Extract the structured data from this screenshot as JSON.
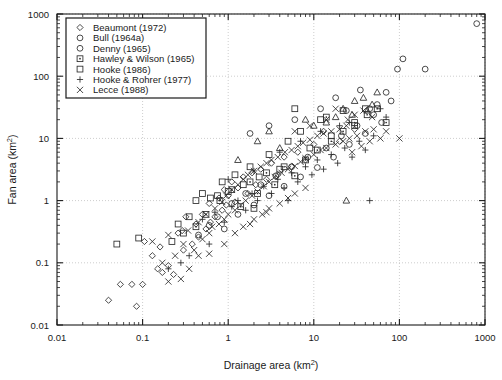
{
  "chart_data": {
    "type": "scatter",
    "title": "",
    "xlabel": "Drainage area (km2)",
    "ylabel": "Fan area (km2)",
    "xlabel_base": "Drainage area (km",
    "xlabel_sup": "2",
    "xlabel_tail": ")",
    "ylabel_base": "Fan area (km",
    "ylabel_sup": "2",
    "ylabel_tail": ")",
    "xscale": "log",
    "yscale": "log",
    "xlim": [
      0.01,
      1000
    ],
    "ylim": [
      0.01,
      1000
    ],
    "grid": true,
    "grid_style": "dotted",
    "legend_position": "top-left-inside",
    "xticks": [
      "0.01",
      "0.1",
      "1",
      "10",
      "100",
      "1000"
    ],
    "xtick_values": [
      0.01,
      0.1,
      1,
      10,
      100,
      1000
    ],
    "yticks": [
      "0.01",
      "0.1",
      "1",
      "10",
      "100",
      "1000"
    ],
    "ytick_values": [
      0.01,
      0.1,
      1,
      10,
      100,
      1000
    ],
    "series": [
      {
        "name": "Beaumont (1972)",
        "marker": "diamond",
        "points": [
          [
            0.04,
            0.025
          ],
          [
            0.055,
            0.045
          ],
          [
            0.075,
            0.045
          ],
          [
            0.085,
            0.02
          ],
          [
            0.1,
            0.045
          ],
          [
            0.105,
            0.22
          ],
          [
            0.13,
            0.13
          ],
          [
            0.15,
            0.08
          ],
          [
            0.16,
            0.18
          ],
          [
            0.17,
            0.07
          ],
          [
            0.2,
            0.09
          ],
          [
            0.23,
            0.065
          ],
          [
            0.26,
            0.3
          ],
          [
            0.29,
            0.33
          ],
          [
            0.3,
            0.16
          ],
          [
            0.32,
            0.55
          ],
          [
            0.38,
            0.2
          ],
          [
            0.42,
            0.42
          ],
          [
            0.45,
            0.26
          ],
          [
            0.5,
            0.6
          ],
          [
            0.55,
            0.35
          ],
          [
            0.6,
            0.9
          ],
          [
            0.62,
            0.45
          ],
          [
            0.7,
            0.55
          ],
          [
            0.78,
            1.1
          ],
          [
            0.85,
            0.7
          ],
          [
            0.9,
            1.5
          ],
          [
            0.95,
            0.85
          ],
          [
            1.0,
            1.2
          ],
          [
            1.1,
            2.0
          ],
          [
            1.2,
            0.95
          ],
          [
            1.3,
            1.6
          ],
          [
            1.5,
            2.4
          ],
          [
            1.7,
            1.3
          ],
          [
            1.9,
            2.8
          ],
          [
            2.1,
            1.8
          ],
          [
            2.4,
            3.2
          ],
          [
            2.8,
            2.2
          ],
          [
            3.2,
            4.0
          ],
          [
            3.8,
            2.6
          ],
          [
            4.5,
            5.0
          ],
          [
            5.5,
            3.5
          ],
          [
            6.5,
            6.0
          ],
          [
            8.0,
            4.5
          ],
          [
            10.0,
            8.0
          ],
          [
            13.0,
            13.0
          ],
          [
            20.0,
            9.0
          ],
          [
            30.0,
            14.0
          ]
        ]
      },
      {
        "name": "Bull (1964a)",
        "marker": "circle",
        "points": [
          [
            0.45,
            0.28
          ],
          [
            0.6,
            0.4
          ],
          [
            0.75,
            0.55
          ],
          [
            0.9,
            0.35
          ],
          [
            1.1,
            0.9
          ],
          [
            1.3,
            0.6
          ],
          [
            1.6,
            1.3
          ],
          [
            2.0,
            0.85
          ],
          [
            2.4,
            1.8
          ],
          [
            3.0,
            1.2
          ],
          [
            3.6,
            2.5
          ],
          [
            4.5,
            1.7
          ],
          [
            5.5,
            3.5
          ],
          [
            7.0,
            2.4
          ],
          [
            8.5,
            5.0
          ],
          [
            11.0,
            3.4
          ],
          [
            14.0,
            7.0
          ],
          [
            17.0,
            5.0
          ],
          [
            21.0,
            11.0
          ],
          [
            26.0,
            8.0
          ],
          [
            32.0,
            16.0
          ],
          [
            40.0,
            12.0
          ],
          [
            50.0,
            24.0
          ],
          [
            55.0,
            35.0
          ],
          [
            62.0,
            18.0
          ],
          [
            70.0,
            55.0
          ],
          [
            80.0,
            40.0
          ],
          [
            95.0,
            130.0
          ],
          [
            110.0,
            190.0
          ],
          [
            200.0,
            130.0
          ],
          [
            800.0,
            700.0
          ],
          [
            1.8,
            12.0
          ],
          [
            3.0,
            16.0
          ],
          [
            6.0,
            20.0
          ],
          [
            12.0,
            30.0
          ],
          [
            18.0,
            45.0
          ],
          [
            24.0,
            28.0
          ],
          [
            35.0,
            60.0
          ],
          [
            45.0,
            30.0
          ]
        ]
      },
      {
        "name": "Denny (1965)",
        "marker": "triangle",
        "points": [
          [
            1.3,
            4.5
          ],
          [
            2.2,
            9.0
          ],
          [
            3.0,
            13.0
          ],
          [
            4.0,
            7.0
          ],
          [
            8.0,
            20.0
          ],
          [
            14.0,
            18.0
          ],
          [
            22.0,
            30.0
          ],
          [
            28.0,
            24.0
          ],
          [
            38.0,
            45.0
          ],
          [
            48.0,
            35.0
          ],
          [
            55.0,
            55.0
          ],
          [
            24.0,
            1.0
          ],
          [
            30.0,
            40.0
          ],
          [
            42.0,
            28.0
          ],
          [
            18.0,
            22.0
          ],
          [
            10.0,
            16.0
          ]
        ]
      },
      {
        "name": "Hawley & Wilson (1965)",
        "marker": "square-dot",
        "points": [
          [
            0.8,
            1.0
          ],
          [
            1.1,
            1.5
          ],
          [
            1.4,
            0.8
          ],
          [
            1.8,
            2.0
          ],
          [
            2.2,
            1.3
          ],
          [
            2.8,
            2.8
          ],
          [
            3.5,
            1.8
          ],
          [
            4.5,
            3.5
          ],
          [
            6.0,
            2.5
          ],
          [
            8.0,
            4.5
          ],
          [
            11.0,
            6.5
          ],
          [
            16.0,
            9.0
          ],
          [
            22.0,
            13.0
          ],
          [
            30.0,
            18.0
          ],
          [
            42.0,
            24.0
          ],
          [
            55.0,
            30.0
          ],
          [
            70.0,
            18.0
          ],
          [
            0.55,
            0.6
          ],
          [
            0.42,
            0.38
          ],
          [
            14.0,
            22.0
          ]
        ]
      },
      {
        "name": "Hooke (1986)",
        "marker": "square",
        "points": [
          [
            0.05,
            0.2
          ],
          [
            0.09,
            0.25
          ],
          [
            0.22,
            0.22
          ],
          [
            0.3,
            0.3
          ],
          [
            0.42,
            1.0
          ],
          [
            0.5,
            1.3
          ],
          [
            0.62,
            1.1
          ],
          [
            0.75,
            1.2
          ],
          [
            0.85,
            2.0
          ],
          [
            1.0,
            1.4
          ],
          [
            1.2,
            2.6
          ],
          [
            1.5,
            1.8
          ],
          [
            1.8,
            3.5
          ],
          [
            2.3,
            2.4
          ],
          [
            3.0,
            5.5
          ],
          [
            4.0,
            3.2
          ],
          [
            5.0,
            9.0
          ],
          [
            7.0,
            13.0
          ],
          [
            9.0,
            7.0
          ],
          [
            12.0,
            20.0
          ],
          [
            16.0,
            11.0
          ],
          [
            22.0,
            28.0
          ],
          [
            30.0,
            16.0
          ],
          [
            40.0,
            30.0
          ],
          [
            0.35,
            0.55
          ],
          [
            0.26,
            0.42
          ],
          [
            2.0,
            0.75
          ],
          [
            6.0,
            30.0
          ]
        ]
      },
      {
        "name": "Hooke & Rohrer (1977)",
        "marker": "plus",
        "points": [
          [
            0.2,
            0.08
          ],
          [
            0.28,
            0.1
          ],
          [
            0.35,
            0.13
          ],
          [
            0.5,
            0.5
          ],
          [
            0.7,
            0.65
          ],
          [
            0.9,
            0.45
          ],
          [
            1.1,
            0.8
          ],
          [
            1.3,
            1.0
          ],
          [
            1.6,
            0.7
          ],
          [
            1.9,
            1.3
          ],
          [
            2.2,
            1.0
          ],
          [
            2.6,
            1.7
          ],
          [
            3.2,
            1.3
          ],
          [
            3.8,
            2.2
          ],
          [
            4.5,
            1.6
          ],
          [
            5.5,
            2.8
          ],
          [
            6.5,
            2.0
          ],
          [
            8.0,
            3.5
          ],
          [
            9.5,
            2.6
          ],
          [
            11.0,
            4.5
          ],
          [
            13.0,
            3.2
          ],
          [
            16.0,
            5.5
          ],
          [
            19.0,
            4.0
          ],
          [
            23.0,
            7.0
          ],
          [
            28.0,
            5.0
          ],
          [
            34.0,
            9.0
          ],
          [
            40.0,
            6.5
          ],
          [
            50.0,
            11.0
          ],
          [
            60.0,
            30.0
          ],
          [
            70.0,
            22.0
          ],
          [
            1.0,
            2.2
          ],
          [
            2.0,
            3.0
          ],
          [
            4.0,
            6.0
          ],
          [
            7.0,
            9.0
          ],
          [
            12.0,
            13.0
          ],
          [
            20.0,
            16.0
          ],
          [
            45.0,
            1.0
          ],
          [
            26.0,
            18.0
          ],
          [
            5.0,
            1.0
          ],
          [
            0.6,
            0.2
          ]
        ]
      },
      {
        "name": "Lecce (1988)",
        "marker": "cross",
        "points": [
          [
            0.13,
            0.22
          ],
          [
            0.17,
            0.1
          ],
          [
            0.2,
            0.28
          ],
          [
            0.24,
            0.13
          ],
          [
            0.3,
            0.2
          ],
          [
            0.34,
            0.33
          ],
          [
            0.4,
            0.16
          ],
          [
            0.45,
            0.45
          ],
          [
            0.5,
            0.24
          ],
          [
            0.55,
            0.6
          ],
          [
            0.6,
            0.3
          ],
          [
            0.65,
            0.38
          ],
          [
            0.7,
            0.75
          ],
          [
            0.78,
            0.42
          ],
          [
            0.85,
            0.95
          ],
          [
            0.9,
            0.5
          ],
          [
            0.95,
            1.2
          ],
          [
            1.0,
            0.6
          ],
          [
            1.1,
            1.5
          ],
          [
            1.2,
            0.7
          ],
          [
            1.3,
            1.8
          ],
          [
            1.4,
            0.85
          ],
          [
            1.5,
            2.2
          ],
          [
            1.6,
            1.0
          ],
          [
            1.7,
            2.6
          ],
          [
            1.9,
            1.2
          ],
          [
            2.0,
            3.0
          ],
          [
            2.2,
            1.4
          ],
          [
            2.4,
            3.5
          ],
          [
            2.6,
            1.7
          ],
          [
            2.8,
            4.0
          ],
          [
            3.0,
            2.0
          ],
          [
            3.2,
            4.5
          ],
          [
            3.5,
            2.4
          ],
          [
            3.8,
            5.0
          ],
          [
            4.2,
            2.8
          ],
          [
            4.6,
            6.0
          ],
          [
            5.0,
            3.2
          ],
          [
            5.5,
            6.5
          ],
          [
            6.0,
            3.6
          ],
          [
            6.5,
            7.5
          ],
          [
            7.0,
            4.2
          ],
          [
            7.5,
            8.5
          ],
          [
            8.0,
            4.8
          ],
          [
            9.0,
            9.5
          ],
          [
            10.0,
            5.5
          ],
          [
            11.0,
            11.0
          ],
          [
            12.0,
            6.5
          ],
          [
            13.0,
            12.0
          ],
          [
            14.0,
            7.0
          ],
          [
            16.0,
            13.0
          ],
          [
            18.0,
            8.0
          ],
          [
            20.0,
            14.0
          ],
          [
            22.0,
            9.0
          ],
          [
            24.0,
            16.0
          ],
          [
            26.0,
            10.0
          ],
          [
            28.0,
            6.0
          ],
          [
            32.0,
            11.0
          ],
          [
            36.0,
            7.5
          ],
          [
            40.0,
            13.0
          ],
          [
            45.0,
            9.0
          ],
          [
            50.0,
            14.0
          ],
          [
            60.0,
            10.0
          ],
          [
            70.0,
            13.0
          ],
          [
            100.0,
            10.0
          ],
          [
            0.45,
            0.13
          ],
          [
            0.6,
            0.14
          ],
          [
            0.9,
            0.2
          ],
          [
            1.2,
            0.3
          ],
          [
            1.5,
            0.38
          ],
          [
            2.0,
            0.5
          ],
          [
            2.5,
            0.6
          ],
          [
            3.0,
            0.75
          ],
          [
            4.0,
            0.9
          ],
          [
            5.0,
            1.1
          ],
          [
            6.0,
            1.3
          ],
          [
            8.0,
            1.6
          ],
          [
            0.35,
            0.08
          ],
          [
            0.28,
            0.055
          ],
          [
            0.2,
            0.05
          ],
          [
            25.0,
            20.0
          ],
          [
            30.0,
            24.0
          ],
          [
            38.0,
            28.0
          ],
          [
            48.0,
            22.0
          ],
          [
            14.0,
            20.0
          ],
          [
            18.0,
            30.0
          ],
          [
            9.0,
            16.0
          ],
          [
            6.0,
            13.0
          ],
          [
            1.8,
            0.42
          ],
          [
            2.8,
            0.65
          ]
        ]
      }
    ]
  },
  "legend": {
    "entries": [
      {
        "label": "Beaumont (1972)",
        "marker": "diamond"
      },
      {
        "label": "Bull (1964a)",
        "marker": "circle"
      },
      {
        "label": "Denny (1965)",
        "marker": "circle-open"
      },
      {
        "label": "Hawley & Wilson (1965)",
        "marker": "square-dot"
      },
      {
        "label": "Hooke (1986)",
        "marker": "square"
      },
      {
        "label": "Hooke & Rohrer (1977)",
        "marker": "plus"
      },
      {
        "label": "Lecce (1988)",
        "marker": "cross"
      }
    ]
  },
  "colors": {
    "marker": "#2b2b2b",
    "axis": "#1a1a1a",
    "grid": "#b9b9b9",
    "background": "#ffffff"
  }
}
